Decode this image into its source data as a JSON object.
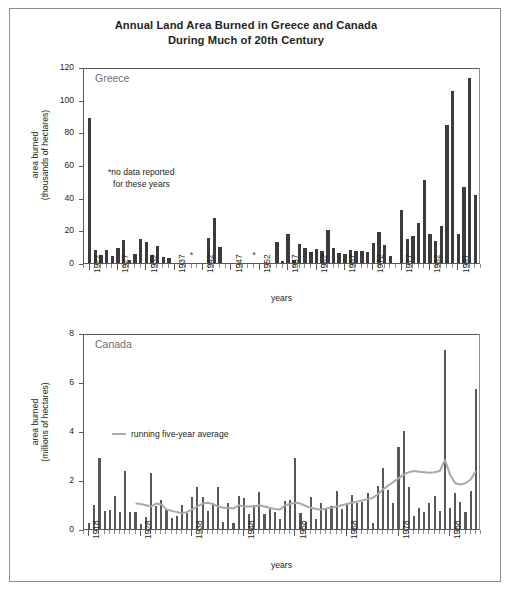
{
  "title": {
    "line1": "Annual Land Area Burned in Greece and Canada",
    "line2": "During Much of 20th Century"
  },
  "chart_data": [
    {
      "type": "bar",
      "id": "greece",
      "title": "Greece",
      "xlabel": "years",
      "ylabel_line1": "area burned",
      "ylabel_line2": "(thousands of hectares)",
      "ylim": [
        0,
        120
      ],
      "yticks": [
        0,
        20,
        40,
        60,
        80,
        100,
        120
      ],
      "xlim": [
        1921,
        1991
      ],
      "xticks": [
        1922,
        1927,
        1932,
        1937,
        1942,
        1947,
        1952,
        1957,
        1962,
        1967,
        1972,
        1977,
        1982,
        1987
      ],
      "grid": false,
      "annotation_line1": "*no data reported",
      "annotation_line2": "for these years",
      "missing_marker": "*",
      "missing_years": [
        1940,
        1951
      ],
      "bar_color": "#3b3b3d",
      "x": [
        1922,
        1923,
        1924,
        1925,
        1926,
        1927,
        1928,
        1929,
        1930,
        1931,
        1932,
        1933,
        1934,
        1935,
        1936,
        1937,
        1938,
        1939,
        1940,
        1941,
        1942,
        1943,
        1944,
        1945,
        1946,
        1947,
        1948,
        1949,
        1950,
        1951,
        1952,
        1953,
        1954,
        1955,
        1956,
        1957,
        1958,
        1959,
        1960,
        1961,
        1962,
        1963,
        1964,
        1965,
        1966,
        1967,
        1968,
        1969,
        1970,
        1971,
        1972,
        1973,
        1974,
        1975,
        1976,
        1977,
        1978,
        1979,
        1980,
        1981,
        1982,
        1983,
        1984,
        1985,
        1986,
        1987,
        1988,
        1989,
        1990
      ],
      "values": [
        88.5,
        8.2,
        4.8,
        8.2,
        4.5,
        9.3,
        14.0,
        1.8,
        5.8,
        14.5,
        12.7,
        5.2,
        10.7,
        3.6,
        3.3,
        0,
        0,
        0,
        null,
        0,
        0,
        15.2,
        27.6,
        9.7,
        0,
        0,
        0,
        0,
        0,
        null,
        0,
        0,
        0,
        13.0,
        1.5,
        17.8,
        2.0,
        11.5,
        9.0,
        6.5,
        8.5,
        7.2,
        20.0,
        9.0,
        6.0,
        5.5,
        7.8,
        7.3,
        7.2,
        6.8,
        12.2,
        19.0,
        10.8,
        4.2,
        0,
        32.5,
        14.4,
        16.8,
        24.5,
        51.0,
        18.0,
        13.5,
        22.5,
        84.5,
        105.5,
        18.0,
        46.5,
        113.0,
        41.5,
        41.0
      ]
    },
    {
      "type": "bar",
      "id": "canada",
      "title": "Canada",
      "xlabel": "years",
      "ylabel_line1": "area burned",
      "ylabel_line2": "(millions of hectares)",
      "ylim": [
        0,
        8
      ],
      "yticks": [
        0,
        2,
        4,
        6,
        8
      ],
      "xlim": [
        1917,
        1994
      ],
      "xticks": [
        1918,
        1928,
        1938,
        1948,
        1958,
        1968,
        1978,
        1988
      ],
      "grid": false,
      "legend_label": "running five-year average",
      "legend_position": "inside-left",
      "bar_color": "#58585a",
      "avg_color": "#a7a9ac",
      "x": [
        1918,
        1919,
        1920,
        1921,
        1922,
        1923,
        1924,
        1925,
        1926,
        1927,
        1928,
        1929,
        1930,
        1931,
        1932,
        1933,
        1934,
        1935,
        1936,
        1937,
        1938,
        1939,
        1940,
        1941,
        1942,
        1943,
        1944,
        1945,
        1946,
        1947,
        1948,
        1949,
        1950,
        1951,
        1952,
        1953,
        1954,
        1955,
        1956,
        1957,
        1958,
        1959,
        1960,
        1961,
        1962,
        1963,
        1964,
        1965,
        1966,
        1967,
        1968,
        1969,
        1970,
        1971,
        1972,
        1973,
        1974,
        1975,
        1976,
        1977,
        1978,
        1979,
        1980,
        1981,
        1982,
        1983,
        1984,
        1985,
        1986,
        1987,
        1988,
        1989,
        1990,
        1991,
        1992,
        1993
      ],
      "values": [
        0.25,
        1.0,
        2.9,
        0.75,
        0.78,
        1.35,
        0.7,
        2.35,
        0.68,
        0.7,
        0.2,
        0.5,
        2.3,
        0.95,
        1.2,
        0.8,
        0.45,
        0.55,
        1.0,
        0.65,
        1.3,
        1.7,
        1.3,
        0.75,
        1.05,
        1.7,
        0.3,
        1.05,
        0.25,
        1.35,
        1.25,
        0.6,
        1.0,
        1.5,
        0.6,
        0.8,
        0.7,
        0.4,
        1.15,
        1.2,
        2.9,
        0.65,
        0.3,
        1.3,
        0.4,
        1.05,
        0.85,
        0.95,
        1.55,
        0.8,
        1.0,
        1.4,
        1.05,
        1.1,
        1.45,
        0.25,
        1.75,
        2.5,
        1.6,
        1.05,
        3.35,
        4.0,
        1.7,
        0.55,
        0.85,
        0.7,
        1.05,
        1.35,
        0.75,
        7.3,
        0.85,
        1.45,
        1.1,
        0.7,
        1.55,
        5.7
      ],
      "series": [
        {
          "name": "running five-year average",
          "x": [
            1927,
            1928,
            1929,
            1930,
            1931,
            1932,
            1933,
            1934,
            1935,
            1936,
            1937,
            1938,
            1939,
            1940,
            1941,
            1942,
            1943,
            1944,
            1945,
            1946,
            1947,
            1948,
            1949,
            1950,
            1951,
            1952,
            1953,
            1954,
            1955,
            1956,
            1957,
            1958,
            1959,
            1960,
            1961,
            1962,
            1963,
            1964,
            1965,
            1966,
            1967,
            1968,
            1969,
            1970,
            1971,
            1972,
            1973,
            1974,
            1975,
            1976,
            1977,
            1978,
            1979,
            1980,
            1981,
            1982,
            1983,
            1984,
            1985,
            1986,
            1987,
            1988,
            1989,
            1990,
            1991,
            1992,
            1993
          ],
          "values": [
            1.12,
            1.1,
            1.05,
            1.0,
            1.12,
            1.08,
            0.88,
            0.82,
            0.78,
            0.72,
            0.78,
            0.88,
            1.0,
            1.12,
            1.15,
            1.1,
            1.0,
            0.95,
            0.95,
            0.92,
            1.05,
            1.0,
            1.0,
            1.0,
            1.05,
            1.0,
            0.95,
            0.9,
            0.88,
            1.05,
            1.1,
            1.15,
            1.12,
            1.02,
            0.95,
            0.9,
            0.88,
            0.92,
            0.95,
            1.0,
            1.05,
            1.1,
            1.15,
            1.2,
            1.25,
            1.3,
            1.35,
            1.5,
            1.7,
            1.85,
            2.0,
            2.15,
            2.3,
            2.4,
            2.45,
            2.42,
            2.4,
            2.38,
            2.4,
            2.45,
            2.9,
            2.3,
            1.95,
            1.9,
            1.95,
            2.1,
            2.45
          ]
        }
      ]
    }
  ]
}
